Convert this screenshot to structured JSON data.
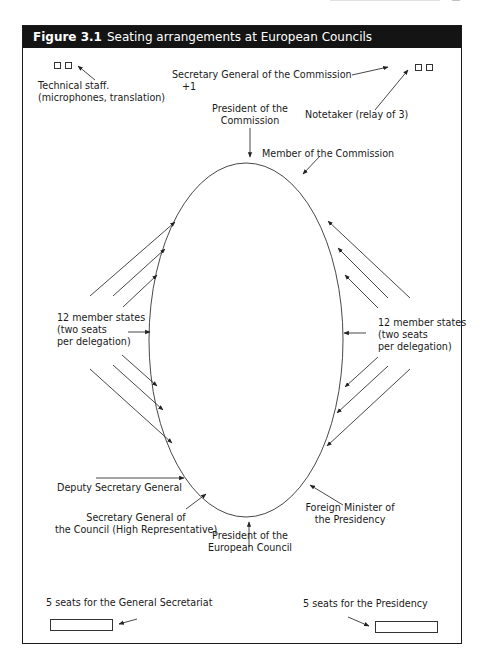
{
  "page_header": {
    "running_head": "",
    "page_number": ""
  },
  "figure": {
    "number": "Figure 3.1",
    "title": "Seating arrangements at European Councils"
  },
  "labels": {
    "technical_staff": [
      "Technical staff.",
      "(microphones, translation)"
    ],
    "secretary_general_commission": [
      "Secretary General of the Commission",
      "+1"
    ],
    "notetaker": "Notetaker (relay of 3)",
    "president_commission": [
      "President of the",
      "Commission"
    ],
    "member_commission": "Member of the Commission",
    "member_states_left": [
      "12 member states",
      "(two seats",
      "per delegation)"
    ],
    "member_states_right": [
      "12 member states",
      "(two seats",
      "per delegation)"
    ],
    "deputy_secretary_general": "Deputy Secretary General",
    "secretary_general_council": [
      "Secretary General of",
      "the Council (High Representative)"
    ],
    "president_european_council": [
      "President of the",
      "European Council"
    ],
    "foreign_minister_presidency": [
      "Foreign Minister of",
      "the Presidency"
    ],
    "seats_general_secretariat": "5 seats for the General Secretariat",
    "seats_presidency": "5 seats for the Presidency"
  },
  "diagram": {
    "table_shape": "ellipse",
    "line_color": "#333333",
    "title_bar_color": "#141414",
    "member_state_arrows_per_side": 6
  }
}
